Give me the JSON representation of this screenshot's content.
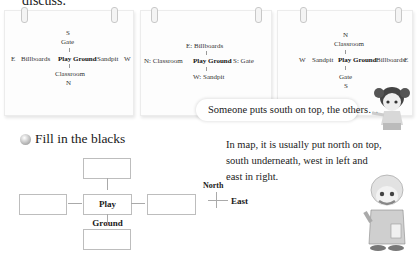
{
  "top_text": "discuss.",
  "cards": [
    {
      "top_dir": "S",
      "top_place": "Gate",
      "left_dir": "E",
      "left_place": "Billboards",
      "center": "Play Ground",
      "right_place": "Sandpit",
      "right_dir": "W",
      "bottom_place": "Classroom",
      "bottom_dir": "N"
    },
    {
      "top_place": "E: Billboards",
      "left_place": "N: Classroom",
      "center": "Play Ground",
      "right_place": "S: Gate",
      "bottom_place": "W: Sandpit"
    },
    {
      "top_dir": "N",
      "top_place": "Classroom",
      "left_dir": "W",
      "left_place": "Sandpit",
      "center": "Play Ground",
      "right_place": "Billboards",
      "right_dir": "E",
      "bottom_place": "Gate",
      "bottom_dir": "S"
    }
  ],
  "girl_speech": "Someone puts south on top, the others…",
  "exercise": {
    "title": "Fill in the blacks",
    "center_label": "Play Ground",
    "blanks": [
      "",
      "",
      "",
      ""
    ]
  },
  "grandpa_speech": "In map, it is usually put north on top, south underneath, west in left and east in right.",
  "compass": {
    "north": "North",
    "east": "East"
  }
}
